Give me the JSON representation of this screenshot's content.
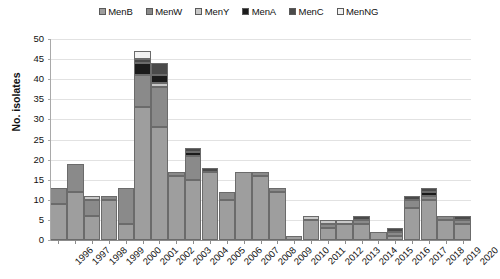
{
  "chart_data": {
    "type": "bar",
    "subtype": "stacked",
    "title": "",
    "xlabel": "",
    "ylabel": "No. isolates",
    "ylim": [
      0,
      50
    ],
    "ytick_step": 5,
    "ytick_labels": [
      "0",
      "5",
      "10",
      "15",
      "20",
      "25",
      "30",
      "35",
      "40",
      "45",
      "50"
    ],
    "grid": true,
    "legend_position": "top-center",
    "categories": [
      "1996",
      "1997",
      "1998",
      "1999",
      "2000",
      "2001",
      "2002",
      "2003",
      "2004",
      "2005",
      "2006",
      "2007",
      "2008",
      "2009",
      "2010",
      "2011",
      "2012",
      "2013",
      "2014",
      "2015",
      "2016",
      "2017",
      "2018",
      "2019",
      "2020"
    ],
    "series": [
      {
        "name": "MenB",
        "color": "#9e9e9e",
        "values": [
          9,
          12,
          6,
          10,
          4,
          33,
          28,
          16,
          15,
          17,
          10,
          17,
          16,
          12,
          1,
          5,
          3,
          4,
          4,
          2,
          1,
          8,
          10,
          5,
          4
        ]
      },
      {
        "name": "MenW",
        "color": "#8a8a8a",
        "values": [
          4,
          7,
          4,
          1,
          9,
          8,
          10,
          1,
          6,
          0,
          2,
          0,
          1,
          1,
          0,
          0,
          1,
          0,
          1,
          0,
          1,
          2,
          1,
          1,
          1
        ]
      },
      {
        "name": "MenY",
        "color": "#c9c9c9",
        "values": [
          0,
          0,
          1,
          0,
          0,
          0,
          1,
          0,
          0,
          0,
          0,
          0,
          0,
          0,
          0,
          1,
          1,
          1,
          0,
          0,
          0,
          0,
          0,
          0,
          0
        ]
      },
      {
        "name": "MenA",
        "color": "#1b1b1b",
        "values": [
          0,
          0,
          0,
          0,
          0,
          3,
          2,
          0,
          1,
          0,
          0,
          0,
          0,
          0,
          0,
          0,
          0,
          0,
          0,
          0,
          0,
          0,
          1,
          0,
          0
        ]
      },
      {
        "name": "MenC",
        "color": "#4a4a4a",
        "values": [
          0,
          0,
          0,
          0,
          0,
          1,
          3,
          0,
          1,
          1,
          0,
          0,
          0,
          0,
          0,
          0,
          0,
          0,
          1,
          0,
          1,
          1,
          1,
          0,
          1
        ]
      },
      {
        "name": "MenNG",
        "color": "#f2f2f2",
        "values": [
          0,
          0,
          0,
          0,
          0,
          2,
          0,
          0,
          0,
          0,
          0,
          0,
          0,
          0,
          0,
          0,
          0,
          0,
          0,
          0,
          0,
          0,
          0,
          0,
          0
        ]
      }
    ],
    "totals": [
      13,
      19,
      11,
      11,
      13,
      47,
      44,
      17,
      23,
      18,
      12,
      17,
      17,
      13,
      1,
      6,
      5,
      5,
      6,
      2,
      3,
      11,
      13,
      6,
      6
    ]
  },
  "legend": {
    "items": [
      {
        "label": "MenB",
        "color": "#9e9e9e"
      },
      {
        "label": "MenW",
        "color": "#8a8a8a"
      },
      {
        "label": "MenY",
        "color": "#c9c9c9"
      },
      {
        "label": "MenA",
        "color": "#1b1b1b"
      },
      {
        "label": "MenC",
        "color": "#4a4a4a"
      },
      {
        "label": "MenNG",
        "color": "#f2f2f2"
      }
    ]
  },
  "axes": {
    "y_title": "No. isolates"
  }
}
